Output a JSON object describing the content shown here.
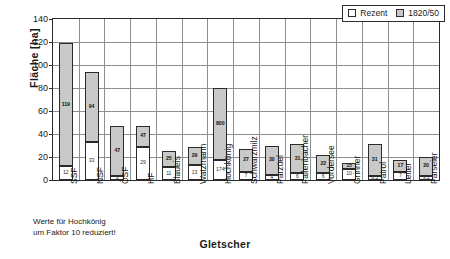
{
  "chart_data": {
    "type": "bar",
    "title": "",
    "xlabel": "Gletscher",
    "ylabel": "Fläche [ha]",
    "ylim": [
      0,
      140
    ],
    "ytick_step": 20,
    "yticks": [
      "0",
      "20",
      "40",
      "60",
      "80",
      "100",
      "120",
      "140"
    ],
    "grid": "horizontal-and-vertical",
    "legend_position": "top-right",
    "note": "Werte für Hochkönig\num Faktor 10 reduziert!",
    "categories": [
      "SSF",
      "NSF",
      "ÖSF",
      "HF",
      "Blaueis",
      "Watzmann",
      "Hochkönig",
      "Schwarzmilz",
      "Parzüel",
      "Fallenbacher",
      "Vordersee",
      "Grinner",
      "Patrol",
      "Leiter",
      "Parseier"
    ],
    "series": [
      {
        "name": "1820/50",
        "color": "#c9c9c9",
        "values": [
          119,
          94,
          47,
          47,
          25,
          29,
          800,
          27,
          30,
          31,
          22,
          15,
          31,
          17,
          20
        ],
        "plotted_values": [
          119,
          94,
          47,
          47,
          25,
          29,
          80,
          27,
          30,
          31,
          22,
          15,
          31,
          17,
          20
        ],
        "labels": [
          "119",
          "94",
          "47",
          "47",
          "25",
          "29",
          "800",
          "27",
          "30",
          "31",
          "22",
          "15",
          "31",
          "17",
          "20"
        ]
      },
      {
        "name": "Rezent",
        "color": "#ffffff",
        "values": [
          12,
          33,
          2,
          29,
          11,
          13,
          174,
          7,
          4,
          6,
          6,
          10,
          0.5,
          7,
          3.1
        ],
        "plotted_values": [
          12,
          33,
          2,
          29,
          11,
          13,
          17.4,
          7,
          4,
          6,
          6,
          10,
          0.5,
          7,
          3.1
        ],
        "labels": [
          "12",
          "33",
          "2",
          "29",
          "11",
          "13",
          "174",
          "7",
          "4",
          "6",
          "6",
          "10",
          "0,5",
          "7",
          "3,1"
        ]
      }
    ]
  },
  "legend": {
    "items": [
      {
        "label": "Rezent",
        "swatch": "white-square-icon"
      },
      {
        "label": "1820/50",
        "swatch": "gray-square-icon"
      }
    ]
  }
}
